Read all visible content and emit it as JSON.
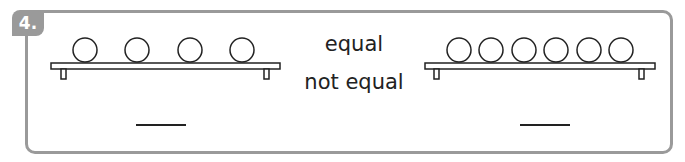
{
  "question": {
    "number": "4.",
    "options": [
      "equal",
      "not equal"
    ],
    "left_shelf": {
      "ball_count": 4,
      "answer_blank": "____"
    },
    "right_shelf": {
      "ball_count": 6,
      "answer_blank": "____"
    }
  },
  "colors": {
    "frame": "#9a9a9a",
    "ink": "#222222"
  }
}
